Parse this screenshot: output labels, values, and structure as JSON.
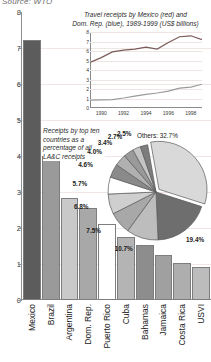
{
  "source": "Source: WTO",
  "bar_chart": {
    "yticks": [
      0,
      1,
      2,
      3,
      4,
      5,
      6,
      7,
      8
    ],
    "ymax": 8
  },
  "line_chart": {
    "title_line1": "Travel receipts by Mexico (red) and",
    "title_line2": "Dom. Rep. (blue), 1989-1999 (US$ billions)",
    "yticks": [
      0,
      1,
      2,
      3,
      4,
      5,
      6,
      7,
      8
    ],
    "xticks": [
      "1990",
      "1992",
      "1994",
      "1996",
      "1998"
    ]
  },
  "pie_caption": "Receipts by top ten countries as a percentage of all LA&C receipts",
  "pie_others_label": "Others: 32.7%",
  "chart_data": [
    {
      "type": "bar",
      "title": "Travel receipts by top ten Latin American & Caribbean countries (US$ billions)",
      "xlabel": "",
      "ylabel": "US$ billions",
      "ylim": [
        0,
        8
      ],
      "grid": true,
      "categories": [
        "Mexico",
        "Brazil",
        "Argentina",
        "Dom. Rep.",
        "Puerto Rico",
        "Cuba",
        "Bahamas",
        "Jamaica",
        "Costa Rica",
        "USVI"
      ],
      "values": [
        7.22,
        4.0,
        2.82,
        2.55,
        2.1,
        1.76,
        1.52,
        1.25,
        1.02,
        0.92
      ],
      "colors": [
        "#5c5c5c",
        "#9a9a9a",
        "#c9c9c9",
        "#a8a8a8",
        "#ffffff",
        "#b4b4b4",
        "#8d8d8d",
        "#a0a0a0",
        "#aeaeae",
        "#bcbcbc"
      ]
    },
    {
      "type": "line",
      "title": "Travel receipts by Mexico (red) and Dom. Rep. (blue), 1989-1999 (US$ billions)",
      "xlabel": "",
      "ylabel": "US$ billions",
      "xlim": [
        1989,
        1999
      ],
      "ylim": [
        0,
        8
      ],
      "grid": true,
      "legend_position": "in-title",
      "x": [
        1989,
        1990,
        1991,
        1992,
        1993,
        1994,
        1995,
        1996,
        1997,
        1998,
        1999
      ],
      "series": [
        {
          "name": "Mexico",
          "color": "#7a5a58",
          "values": [
            4.8,
            5.3,
            5.9,
            6.1,
            6.2,
            6.4,
            6.2,
            6.9,
            7.5,
            7.6,
            7.2
          ]
        },
        {
          "name": "Dom. Rep.",
          "color": "#9a9a9a",
          "values": [
            0.82,
            0.85,
            0.88,
            1.05,
            1.25,
            1.43,
            1.58,
            1.78,
            2.1,
            2.2,
            2.5
          ]
        }
      ]
    },
    {
      "type": "pie",
      "title": "Receipts by top ten countries as a percentage of all LA&C receipts",
      "labels": [
        "Others",
        "Mexico",
        "Brazil",
        "Argentina",
        "Dom. Rep.",
        "Puerto Rico",
        "Cuba",
        "Bahamas",
        "Jamaica",
        "Costa Rica",
        "USVI"
      ],
      "values": [
        32.7,
        19.4,
        10.7,
        7.5,
        6.8,
        5.7,
        4.6,
        4.0,
        3.4,
        2.7,
        2.5
      ],
      "colors": [
        "#d9d9d9",
        "#6e6e6e",
        "#bdbdbd",
        "#a8a8a8",
        "#cfcfcf",
        "#ffffff",
        "#8a8a8a",
        "#b0b0b0",
        "#9a9a9a",
        "#c4c4c4",
        "#7d7d7d"
      ],
      "shown_labels": [
        "Others: 32.7%",
        "19.4%",
        "10.7%",
        "7.5%",
        "6.8%",
        "5.7%",
        "4.6%",
        "4.0%",
        "3.4%",
        "2.7%",
        "2.5%"
      ]
    }
  ]
}
